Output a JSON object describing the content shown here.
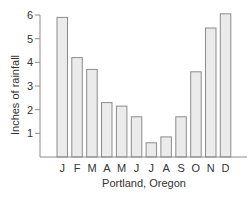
{
  "chart_data": {
    "type": "bar",
    "title": "",
    "xlabel": "Portland, Oregon",
    "ylabel": "Inches of rainfall",
    "categories": [
      "J",
      "F",
      "M",
      "A",
      "M",
      "J",
      "J",
      "A",
      "S",
      "O",
      "N",
      "D"
    ],
    "values": [
      5.9,
      4.2,
      3.7,
      2.3,
      2.15,
      1.7,
      0.6,
      0.85,
      1.7,
      3.6,
      5.45,
      6.05
    ],
    "ylim": [
      0,
      6
    ],
    "yticks": [
      1,
      2,
      3,
      4,
      5,
      6
    ],
    "grid": false,
    "legend": null
  },
  "style": {
    "bar_fill": "#ebebeb",
    "bar_stroke": "#8c8c8c",
    "axis_color": "#8c8c8c",
    "text_color": "#333333"
  }
}
